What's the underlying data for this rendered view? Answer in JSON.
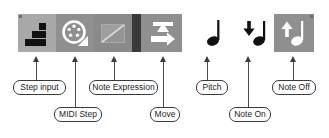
{
  "toolbar": {
    "name": "step-input-toolbar",
    "buttons": [
      {
        "id": "step-input",
        "icon": "step-staircase-icon",
        "state": "active",
        "bg": "#a8a8a8"
      },
      {
        "id": "midi-step",
        "icon": "midi-din-icon",
        "state": "normal",
        "bg": "#8f8f8f"
      },
      {
        "id": "note-expression",
        "icon": "note-expression-icon",
        "state": "disabled",
        "bg": "#8a8a8a"
      },
      {
        "id": "move",
        "icon": "move-arrows-icon",
        "state": "normal",
        "bg": "#8f8f8f"
      },
      {
        "id": "pitch",
        "icon": "quarter-note-icon",
        "state": "plain",
        "bg": "#ffffff"
      },
      {
        "id": "note-on",
        "icon": "note-on-down-arrow-icon",
        "state": "plain",
        "bg": "#ffffff"
      },
      {
        "id": "note-off",
        "icon": "note-off-up-arrow-icon",
        "state": "active",
        "bg": "#8f8f8f"
      }
    ]
  },
  "callouts": {
    "step_input": "Step input",
    "midi_step": "MIDI Step",
    "note_expression": "Note Expression",
    "move": "Move",
    "pitch": "Pitch",
    "note_on": "Note On",
    "note_off": "Note Off"
  },
  "colors": {
    "toolbar_light": "#a8a8a8",
    "toolbar_mid": "#8f8f8f",
    "toolbar_gap": "#3a3a3a",
    "icon_black": "#111111",
    "icon_white": "#ffffff",
    "label_border": "#3b3b3b",
    "label_text": "#1c1c1c"
  }
}
